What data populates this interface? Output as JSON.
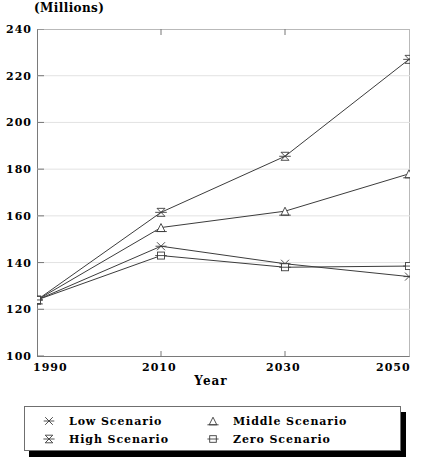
{
  "chart_data": {
    "type": "line",
    "title": "(Millions)",
    "xlabel": "Year",
    "ylabel": "",
    "x": [
      1990,
      2010,
      2030,
      2050
    ],
    "xtick_labels": [
      "1990",
      "2010",
      "2030",
      "2050"
    ],
    "ytick_labels": [
      "100",
      "120",
      "140",
      "160",
      "180",
      "200",
      "220",
      "240"
    ],
    "yticks": [
      100,
      120,
      140,
      160,
      180,
      200,
      220,
      240
    ],
    "ylim": [
      100,
      240
    ],
    "xlim": [
      1990,
      2050
    ],
    "grid": true,
    "legend_position": "below",
    "series": [
      {
        "name": "Low Scenario",
        "marker": "x-bar",
        "values": [
          124,
          147,
          139.5,
          134
        ]
      },
      {
        "name": "Middle Scenario",
        "marker": "triangle-bar",
        "values": [
          124,
          155,
          162,
          178
        ]
      },
      {
        "name": "High Scenario",
        "marker": "star-bar",
        "values": [
          124,
          161.5,
          185.5,
          227
        ]
      },
      {
        "name": "Zero Scenario",
        "marker": "square-bar",
        "values": [
          124,
          143,
          138,
          138.5
        ]
      }
    ]
  },
  "legend": {
    "items": [
      {
        "label": "Low Scenario",
        "marker": "x-bar"
      },
      {
        "label": "Middle Scenario",
        "marker": "triangle-bar"
      },
      {
        "label": "High Scenario",
        "marker": "star-bar"
      },
      {
        "label": "Zero Scenario",
        "marker": "square-bar"
      }
    ]
  },
  "colors": {
    "line": "#3c3c3c",
    "grid": "#e2e2e2",
    "axis": "#777777",
    "text": "#000000",
    "legend_shadow": "#000000"
  }
}
